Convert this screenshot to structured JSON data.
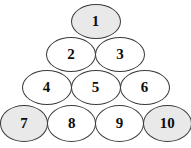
{
  "figure": {
    "name": "numbered-ellipse-pyramid",
    "background_color": "#ffffff",
    "outline_color": "#3a3a3a",
    "shaded_fill_color": "#e9e9e9",
    "plain_fill_color": "#ffffff",
    "text_color": "#0d0d0d"
  },
  "rows": [
    {
      "index": 1,
      "nodes": [
        {
          "label": "1",
          "shaded": true
        }
      ]
    },
    {
      "index": 2,
      "nodes": [
        {
          "label": "2",
          "shaded": false
        },
        {
          "label": "3",
          "shaded": false
        }
      ]
    },
    {
      "index": 3,
      "nodes": [
        {
          "label": "4",
          "shaded": false
        },
        {
          "label": "5",
          "shaded": false
        },
        {
          "label": "6",
          "shaded": false
        }
      ]
    },
    {
      "index": 4,
      "nodes": [
        {
          "label": "7",
          "shaded": true
        },
        {
          "label": "8",
          "shaded": false
        },
        {
          "label": "9",
          "shaded": false
        },
        {
          "label": "10",
          "shaded": true
        }
      ]
    }
  ]
}
